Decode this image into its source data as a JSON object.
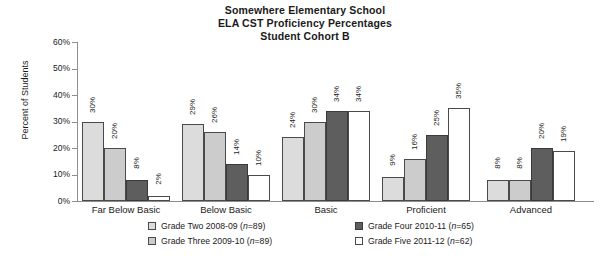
{
  "chart_data": {
    "type": "bar",
    "title": "Somewhere Elementary School\nELA CST Proficiency Percentages\nStudent Cohort B",
    "title_lines": [
      "Somewhere Elementary School",
      "ELA CST Proficiency Percentages",
      "Student Cohort B"
    ],
    "xlabel": "",
    "ylabel": "Percent of Students",
    "ylim": [
      0,
      60
    ],
    "ytick_labels": [
      "60%",
      "50%",
      "40%",
      "30%",
      "20%",
      "10%",
      "0%"
    ],
    "ytick_values": [
      60,
      50,
      40,
      30,
      20,
      10,
      0
    ],
    "grid": false,
    "legend_position": "bottom",
    "categories": [
      "Far Below Basic",
      "Below Basic",
      "Basic",
      "Proficient",
      "Advanced"
    ],
    "series": [
      {
        "name": "Grade Two 2008-09 (n=89)",
        "label_prefix": "Grade Two 2008-09 (",
        "label_italic": "n",
        "label_suffix": "=89)",
        "color": "#dcdcdc",
        "values": [
          30,
          29,
          24,
          9,
          8
        ],
        "value_labels": [
          "30%",
          "29%",
          "24%",
          "9%",
          "8%"
        ]
      },
      {
        "name": "Grade Three 2009-10 (n=89)",
        "label_prefix": "Grade Three 2009-10 (",
        "label_italic": "n",
        "label_suffix": "=89)",
        "color": "#cccccc",
        "values": [
          20,
          26,
          30,
          16,
          8
        ],
        "value_labels": [
          "20%",
          "26%",
          "30%",
          "16%",
          "8%"
        ]
      },
      {
        "name": "Grade Four 2010-11 (n=65)",
        "label_prefix": "Grade Four 2010-11 (",
        "label_italic": "n",
        "label_suffix": "=65)",
        "color": "#5e5e5e",
        "values": [
          8,
          14,
          34,
          25,
          20
        ],
        "value_labels": [
          "8%",
          "14%",
          "34%",
          "25%",
          "20%"
        ]
      },
      {
        "name": "Grade Five 2011-12 (n=62)",
        "label_prefix": "Grade Five 2011-12 (",
        "label_italic": "n",
        "label_suffix": "=62)",
        "color": "#ffffff",
        "values": [
          2,
          10,
          34,
          35,
          19
        ],
        "value_labels": [
          "2%",
          "10%",
          "34%",
          "35%",
          "19%"
        ]
      }
    ]
  }
}
